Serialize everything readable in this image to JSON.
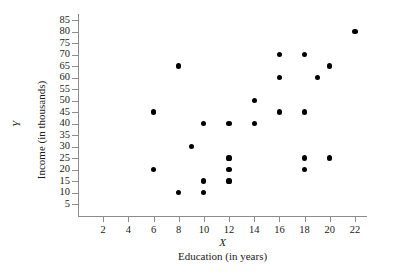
{
  "chart_data": {
    "type": "scatter",
    "title": "",
    "xlabel": "Education (in years)",
    "ylabel": "Income (in thousands)",
    "x_variable": "X",
    "y_variable": "Y",
    "xlim": [
      0,
      23
    ],
    "ylim": [
      0,
      88
    ],
    "grid": false,
    "legend": null,
    "x_ticks": [
      2,
      4,
      6,
      8,
      10,
      12,
      14,
      16,
      18,
      20,
      22
    ],
    "y_ticks": [
      5,
      10,
      15,
      20,
      25,
      30,
      35,
      40,
      45,
      50,
      55,
      60,
      65,
      70,
      75,
      80,
      85
    ],
    "marker": {
      "shape": "circle",
      "color": "#000000",
      "size": 5
    },
    "axis_color": "#8c8c8c",
    "points": [
      {
        "x": 6,
        "y": 45
      },
      {
        "x": 6,
        "y": 20
      },
      {
        "x": 8,
        "y": 65
      },
      {
        "x": 8,
        "y": 10
      },
      {
        "x": 9,
        "y": 30
      },
      {
        "x": 10,
        "y": 40
      },
      {
        "x": 10,
        "y": 15
      },
      {
        "x": 10,
        "y": 10
      },
      {
        "x": 12,
        "y": 40
      },
      {
        "x": 12,
        "y": 25
      },
      {
        "x": 12,
        "y": 20
      },
      {
        "x": 12,
        "y": 15
      },
      {
        "x": 14,
        "y": 50
      },
      {
        "x": 14,
        "y": 40
      },
      {
        "x": 16,
        "y": 70
      },
      {
        "x": 16,
        "y": 60
      },
      {
        "x": 16,
        "y": 45
      },
      {
        "x": 18,
        "y": 70
      },
      {
        "x": 18,
        "y": 45
      },
      {
        "x": 18,
        "y": 25
      },
      {
        "x": 18,
        "y": 20
      },
      {
        "x": 19,
        "y": 60
      },
      {
        "x": 20,
        "y": 65
      },
      {
        "x": 20,
        "y": 25
      },
      {
        "x": 22,
        "y": 80
      }
    ]
  }
}
